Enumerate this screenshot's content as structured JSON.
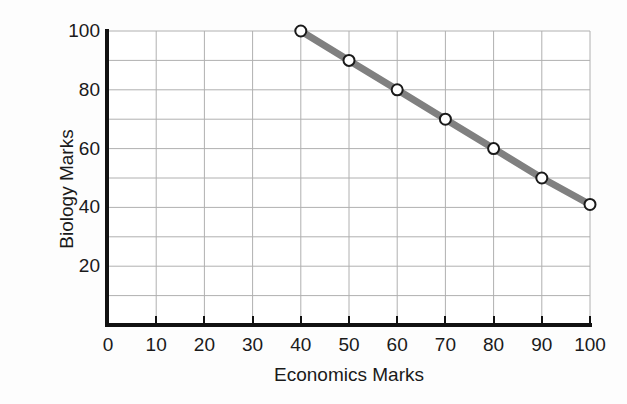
{
  "chart_data": {
    "type": "line",
    "title": "",
    "xlabel": "Economics Marks",
    "ylabel": "Biology Marks",
    "xlim": [
      0,
      100
    ],
    "ylim": [
      0,
      100
    ],
    "xticks": [
      0,
      10,
      20,
      30,
      40,
      50,
      60,
      70,
      80,
      90,
      100
    ],
    "yticks": [
      0,
      20,
      40,
      60,
      80,
      100
    ],
    "xtick_labels": [
      "0",
      "10",
      "20",
      "30",
      "40",
      "50",
      "60",
      "70",
      "80",
      "90",
      "100"
    ],
    "ytick_labels": [
      "",
      "20",
      "40",
      "60",
      "80",
      "100"
    ],
    "grid": true,
    "grid_step_x": 10,
    "grid_step_y": 10,
    "legend": "none",
    "series": [
      {
        "name": "Biology vs Economics",
        "x": [
          40,
          50,
          60,
          70,
          80,
          90,
          100
        ],
        "values": [
          100,
          90,
          80,
          70,
          60,
          50,
          41
        ],
        "line_color": "#808080",
        "marker": "circle",
        "marker_face_color": "#ffffff",
        "marker_edge_color": "#1a1a1a"
      }
    ]
  },
  "style": {
    "background": "#fdfdfd",
    "plot_background": "#ffffff",
    "grid_color": "#b0b0b0",
    "axis_color": "#111111",
    "text_color": "#1a1a1a",
    "line_color": "#808080"
  }
}
